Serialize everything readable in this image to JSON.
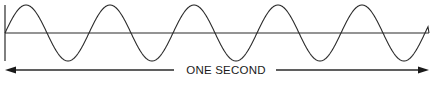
{
  "diagram": {
    "title": "",
    "type": "sine-wave-period",
    "cycles_shown": 5,
    "duration_label": "ONE SECOND",
    "colors": {
      "stroke": "#2a2a2a",
      "background": "#ffffff"
    }
  },
  "wave": {
    "x_start": 5,
    "x_end": 428,
    "baseline_y": 33,
    "amplitude": 28,
    "period_px": 84
  },
  "axis": {
    "x": 5,
    "y_top": 5,
    "y_bottom": 61
  },
  "arrow": {
    "y": 70,
    "left_x1": 5,
    "left_x2": 174,
    "right_x1": 271,
    "right_x2": 429
  }
}
